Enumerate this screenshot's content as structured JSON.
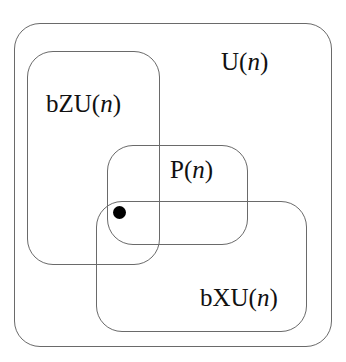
{
  "diagram": {
    "type": "euler-diagram",
    "sets": [
      {
        "id": "U",
        "prefix": "U(",
        "var": "n",
        "suffix": ")",
        "role": "universe"
      },
      {
        "id": "bZU",
        "prefix": "bZU(",
        "var": "n",
        "suffix": ")"
      },
      {
        "id": "P",
        "prefix": "P(",
        "var": "n",
        "suffix": ")"
      },
      {
        "id": "bXU",
        "prefix": "bXU(",
        "var": "n",
        "suffix": ")"
      }
    ],
    "point": {
      "description": "element in intersection of bZU(n), P(n), and bXU(n)"
    },
    "colors": {
      "stroke": "#6a6a6a",
      "text": "#111111",
      "dot": "#000000"
    }
  }
}
